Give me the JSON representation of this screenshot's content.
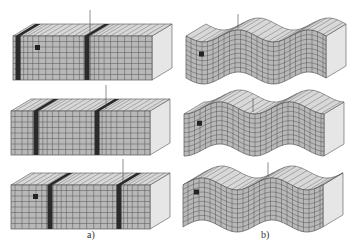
{
  "figure": {
    "panels": [
      {
        "id": "a",
        "label": "a)",
        "description": "Compressional (P) wave: block with vertical dark compression bands moving along",
        "frames": 3
      },
      {
        "id": "b",
        "label": "b)",
        "description": "Shear (S) wave: block deformed into sinusoidal undulations",
        "frames": 3
      }
    ],
    "colors": {
      "face": "#b8b8b8",
      "grid": "#555555",
      "band": "#2a2a2a",
      "side": "#e6e6e6",
      "top": "#d8d8d8",
      "marker": "#222222"
    }
  }
}
